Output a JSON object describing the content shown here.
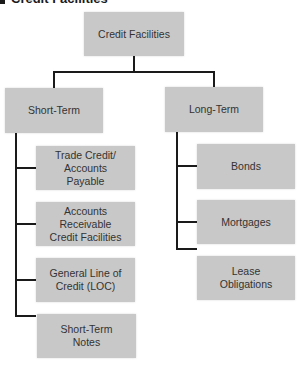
{
  "header": {
    "title": "Credit Facilities"
  },
  "diagram": {
    "root": {
      "label": "Credit Facilities"
    },
    "branches": [
      {
        "label": "Short-Term",
        "children": [
          {
            "label": "Trade Credit/\nAccounts\nPayable"
          },
          {
            "label": "Accounts\nReceivable\nCredit Facilities"
          },
          {
            "label": "General Line of\nCredit (LOC)"
          },
          {
            "label": "Short-Term\nNotes"
          }
        ]
      },
      {
        "label": "Long-Term",
        "children": [
          {
            "label": "Bonds"
          },
          {
            "label": "Mortgages"
          },
          {
            "label": "Lease\nObligations"
          }
        ]
      }
    ]
  },
  "colors": {
    "box_fill": "#c8c8c8",
    "line": "#1a1a1a",
    "text": "#333333"
  }
}
